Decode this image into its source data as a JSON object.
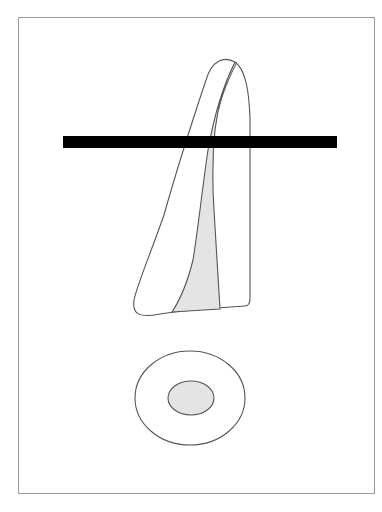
{
  "figure": {
    "colors": {
      "background": "#ffffff",
      "frame": "#9a9a9a",
      "outline": "#555555",
      "canal_fill": "#e4e4e4",
      "section_bar": "#000000"
    },
    "parts": [
      "frame",
      "tooth-outline",
      "root-canal",
      "section-bar",
      "cross-section-outer",
      "cross-section-canal"
    ]
  }
}
